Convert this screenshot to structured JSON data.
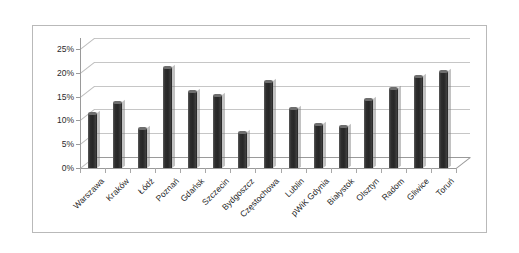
{
  "chart_data": {
    "type": "bar",
    "title": "",
    "subtitle": "",
    "xlabel": "",
    "ylabel": "",
    "ylim": [
      0,
      25
    ],
    "ytick_labels": [
      "0%",
      "5%",
      "10%",
      "15%",
      "20%",
      "25%"
    ],
    "ytick_values": [
      0,
      5,
      10,
      15,
      20,
      25
    ],
    "grid": true,
    "legend": false,
    "legend_position": "none",
    "style": "3d-column",
    "bar_color": "#333333",
    "categories": [
      "Warszawa",
      "Kraków",
      "Łódź",
      "Poznań",
      "Gdańsk",
      "Szczecin",
      "Bydgoszcz",
      "Częstochowa",
      "Lublin",
      "pWiK Gdynia",
      "Białystok",
      "Olsztyn",
      "Radom",
      "Gliwice",
      "Toruń"
    ],
    "values": [
      11.3,
      13.6,
      8.2,
      21.1,
      16.0,
      15.2,
      7.4,
      18.0,
      12.5,
      9.0,
      8.7,
      14.2,
      16.7,
      19.2,
      20.2
    ],
    "value_unit": "%"
  },
  "axis": {
    "value_axis_max_label": "25%",
    "value_axis_min_label": "0%"
  }
}
